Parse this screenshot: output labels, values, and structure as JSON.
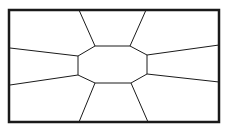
{
  "diagram": {
    "type": "radial-partition",
    "background": "#ffffff",
    "stroke": "#1a1a1a",
    "frame": {
      "x": 9,
      "y": 10,
      "width": 210,
      "height": 112,
      "stroke_width": 2.5
    },
    "center_octagon": {
      "points": "95,46 130,46 147,55 147,74 131,83 95,83 78,75 78,56",
      "stroke_width": 1
    },
    "spokes": [
      {
        "x1": 95,
        "y1": 46,
        "x2": 79,
        "y2": 10
      },
      {
        "x1": 130,
        "y1": 46,
        "x2": 146,
        "y2": 10
      },
      {
        "x1": 147,
        "y1": 55,
        "x2": 219,
        "y2": 45
      },
      {
        "x1": 147,
        "y1": 74,
        "x2": 219,
        "y2": 82
      },
      {
        "x1": 131,
        "y1": 83,
        "x2": 148,
        "y2": 122
      },
      {
        "x1": 95,
        "y1": 83,
        "x2": 79,
        "y2": 122
      },
      {
        "x1": 78,
        "y1": 75,
        "x2": 10,
        "y2": 85
      },
      {
        "x1": 78,
        "y1": 56,
        "x2": 10,
        "y2": 48
      }
    ]
  }
}
